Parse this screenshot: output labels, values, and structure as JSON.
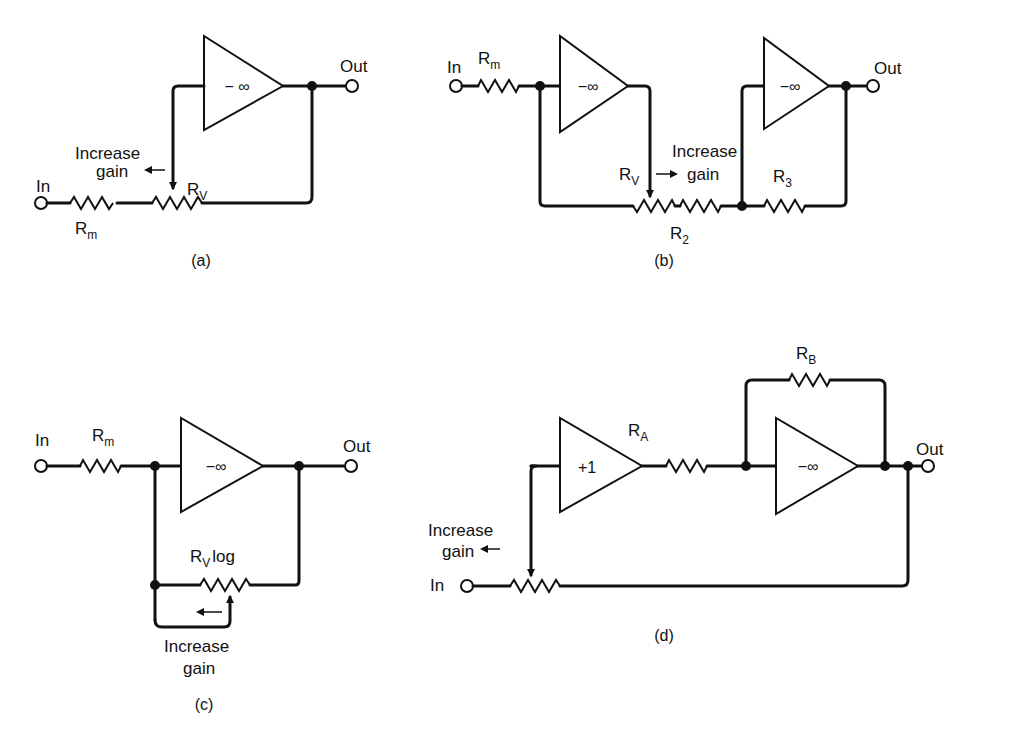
{
  "diagram": {
    "type": "circuit-schematic",
    "panels": [
      {
        "id": "a",
        "caption": "(a)",
        "labels": {
          "in": "In",
          "out": "Out",
          "rm": "R",
          "rm_sub": "m",
          "rv": "R",
          "rv_sub": "V",
          "amp": "− ∞",
          "gain1": "Increase",
          "gain2": "gain"
        }
      },
      {
        "id": "b",
        "caption": "(b)",
        "labels": {
          "in": "In",
          "out": "Out",
          "rm": "R",
          "rm_sub": "m",
          "rv": "R",
          "rv_sub": "V",
          "r2": "R",
          "r2_sub": "2",
          "r3": "R",
          "r3_sub": "3",
          "amp1": "−∞",
          "amp2": "−∞",
          "gain1": "Increase",
          "gain2": "gain"
        }
      },
      {
        "id": "c",
        "caption": "(c)",
        "labels": {
          "in": "In",
          "out": "Out",
          "rm": "R",
          "rm_sub": "m",
          "rv": "R",
          "rv_sub": "V",
          "rv_suffix": "log",
          "amp": "−∞",
          "gain1": "Increase",
          "gain2": "gain"
        }
      },
      {
        "id": "d",
        "caption": "(d)",
        "labels": {
          "in": "In",
          "out": "Out",
          "ra": "R",
          "ra_sub": "A",
          "rb": "R",
          "rb_sub": "B",
          "amp1": "+1",
          "amp2": "−∞",
          "gain1": "Increase",
          "gain2": "gain"
        }
      }
    ]
  }
}
